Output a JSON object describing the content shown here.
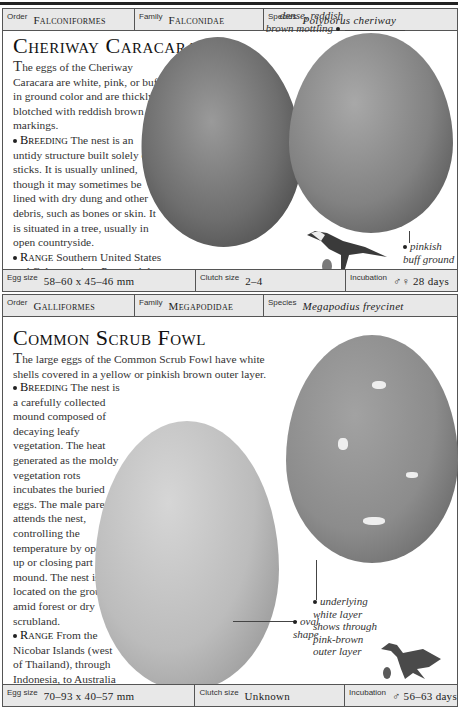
{
  "sections": [
    {
      "header": {
        "order_label": "Order",
        "order": "Falconiformes",
        "family_label": "Family",
        "family": "Falconidae",
        "species_label": "Species",
        "species": "Polyborus cheriway"
      },
      "title": "Cheriway Caracara",
      "intro_lead": "T",
      "intro": "he eggs of the Cheriway Caracara are white, pink, or buff in ground color and are thickly blotched with reddish brown markings.",
      "breeding_label": "Breeding",
      "breeding": "The nest is an untidy structure built solely of sticks. It is usually unlined, though it may sometimes be lined with dry dung and other debris, such as bones or skin. It is situated in a tree, usually in open countryside.",
      "range_label": "Range",
      "range": "Southern United States and Cuba, south to Peru and the Guianas in South America.",
      "annotations": [
        "dense, reddish brown mottling",
        "pinkish buff ground"
      ],
      "footer": {
        "egg_size_label": "Egg size",
        "egg_size": "58–60 x 45–46 mm",
        "clutch_label": "Clutch size",
        "clutch": "2–4",
        "incubation_label": "Incubation",
        "incubation": "♂♀ 28 days"
      },
      "colors": {
        "egg1": "#7a7a7a",
        "egg2": "#8a8a8a"
      }
    },
    {
      "header": {
        "order_label": "Order",
        "order": "Galliformes",
        "family_label": "Family",
        "family": "Megapodidae",
        "species_label": "Species",
        "species": "Megapodius freycinet"
      },
      "title": "Common Scrub Fowl",
      "intro_lead": "T",
      "intro": "he large eggs of the Common Scrub Fowl have white shells covered in a yellow or pinkish brown outer layer.",
      "breeding_label": "Breeding",
      "breeding": "The nest is a carefully collected mound composed of decaying leafy vegetation. The heat generated as the moldy vegetation rots incubates the buried eggs. The male parent attends the nest, controlling the temperature by opening up or closing part of the mound. The nest is located on the ground, amid forest or dry scrubland.",
      "range_label": "Range",
      "range": "From the Nicobar Islands (west of Thailand), through Indonesia, to Australia and the New Hebrides.",
      "annotations": [
        "oval shape",
        "underlying white layer shows through pink-brown outer layer"
      ],
      "footer": {
        "egg_size_label": "Egg size",
        "egg_size": "70–93 x 40–57 mm",
        "clutch_label": "Clutch size",
        "clutch": "Unknown",
        "incubation_label": "Incubation",
        "incubation": "♂ 56–63 days"
      },
      "colors": {
        "egg1": "#bdbdbd",
        "egg2": "#8f8f8f"
      }
    }
  ]
}
